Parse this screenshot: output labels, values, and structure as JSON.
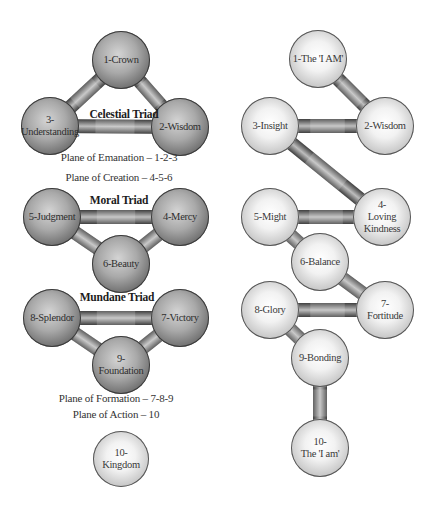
{
  "colors": {
    "background": "#ffffff",
    "dark_sphere": "#8a8a8a",
    "light_sphere": "#f0f0f0",
    "connector": "#6e6e6e",
    "text": "#2e2e2e"
  },
  "left_tree": {
    "triads": [
      {
        "id": "celestial",
        "title": "Celestial Triad",
        "x": 124,
        "y": 115
      },
      {
        "id": "moral",
        "title": "Moral Triad",
        "x": 119,
        "y": 201
      },
      {
        "id": "mundane",
        "title": "Mundane Triad",
        "x": 117,
        "y": 298
      }
    ],
    "planes": [
      {
        "id": "emanation",
        "label": "Plane of Emanation – 1-2-3",
        "x": 119,
        "y": 158
      },
      {
        "id": "creation",
        "label": "Plane of Creation – 4-5-6",
        "x": 119,
        "y": 178
      },
      {
        "id": "formation",
        "label": "Plane of Formation – 7-8-9",
        "x": 116,
        "y": 399
      },
      {
        "id": "action",
        "label": "Plane of Action – 10",
        "x": 116,
        "y": 415
      }
    ],
    "nodes": [
      {
        "id": "L1",
        "label": "1-Crown",
        "x": 121,
        "y": 60,
        "r": 29,
        "style": "dark"
      },
      {
        "id": "L2",
        "label": "2-Wisdom",
        "x": 180,
        "y": 127,
        "r": 29,
        "style": "dark"
      },
      {
        "id": "L3",
        "label": "3-\nUnderstanding",
        "x": 50,
        "y": 126,
        "r": 29,
        "style": "dark"
      },
      {
        "id": "L4",
        "label": "4-Mercy",
        "x": 180,
        "y": 217,
        "r": 29,
        "style": "dark"
      },
      {
        "id": "L5",
        "label": "5-Judgment",
        "x": 52,
        "y": 217,
        "r": 29,
        "style": "dark"
      },
      {
        "id": "L6",
        "label": "6-Beauty",
        "x": 121,
        "y": 264,
        "r": 29,
        "style": "dark"
      },
      {
        "id": "L7",
        "label": "7-Victory",
        "x": 180,
        "y": 318,
        "r": 29,
        "style": "dark"
      },
      {
        "id": "L8",
        "label": "8-Splendor",
        "x": 52,
        "y": 318,
        "r": 29,
        "style": "dark"
      },
      {
        "id": "L9",
        "label": "9-\nFoundation",
        "x": 121,
        "y": 365,
        "r": 29,
        "style": "dark"
      },
      {
        "id": "L10",
        "label": "10-\nKingdom",
        "x": 121,
        "y": 459,
        "r": 28,
        "style": "light"
      }
    ],
    "connectors": [
      [
        "L1",
        "L2"
      ],
      [
        "L1",
        "L3"
      ],
      [
        "L3",
        "L2"
      ],
      [
        "L5",
        "L4"
      ],
      [
        "L5",
        "L6"
      ],
      [
        "L4",
        "L6"
      ],
      [
        "L8",
        "L7"
      ],
      [
        "L8",
        "L9"
      ],
      [
        "L7",
        "L9"
      ]
    ]
  },
  "right_tree": {
    "nodes": [
      {
        "id": "R1",
        "label": "1-The 'I AM'",
        "x": 318,
        "y": 59,
        "r": 29,
        "style": "light"
      },
      {
        "id": "R2",
        "label": "2-Wisdom",
        "x": 385,
        "y": 126,
        "r": 29,
        "style": "light"
      },
      {
        "id": "R3",
        "label": "3-Insight",
        "x": 270,
        "y": 126,
        "r": 29,
        "style": "light"
      },
      {
        "id": "R4",
        "label": "4-\nLoving\nKindness",
        "x": 382,
        "y": 217,
        "r": 29,
        "style": "light"
      },
      {
        "id": "R5",
        "label": "5-Might",
        "x": 270,
        "y": 217,
        "r": 29,
        "style": "light"
      },
      {
        "id": "R6",
        "label": "6-Balance",
        "x": 320,
        "y": 262,
        "r": 29,
        "style": "light"
      },
      {
        "id": "R7",
        "label": "7-\nFortitude",
        "x": 385,
        "y": 310,
        "r": 29,
        "style": "light"
      },
      {
        "id": "R8",
        "label": "8-Glory",
        "x": 270,
        "y": 310,
        "r": 29,
        "style": "light"
      },
      {
        "id": "R9",
        "label": "9-Bonding",
        "x": 320,
        "y": 358,
        "r": 29,
        "style": "light"
      },
      {
        "id": "R10",
        "label": "10-\nThe 'I am'",
        "x": 320,
        "y": 448,
        "r": 29,
        "style": "light"
      }
    ],
    "connectors": [
      [
        "R1",
        "R2"
      ],
      [
        "R3",
        "R2"
      ],
      [
        "R3",
        "R4"
      ],
      [
        "R5",
        "R4"
      ],
      [
        "R5",
        "R6"
      ],
      [
        "R6",
        "R7"
      ],
      [
        "R8",
        "R7"
      ],
      [
        "R8",
        "R9"
      ],
      [
        "R9",
        "R10"
      ]
    ]
  }
}
